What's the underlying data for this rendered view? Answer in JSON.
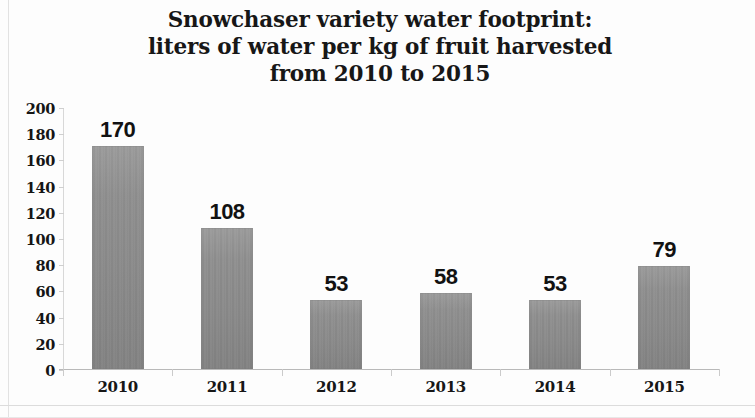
{
  "chart_data": {
    "type": "bar",
    "title": "Snowchaser variety water footprint:\nliters of water per kg of fruit harvested\nfrom 2010 to 2015",
    "categories": [
      "2010",
      "2011",
      "2012",
      "2013",
      "2014",
      "2015"
    ],
    "values": [
      170,
      108,
      53,
      58,
      53,
      79
    ],
    "data_labels": [
      "170",
      "108",
      "53",
      "58",
      "53",
      "79"
    ],
    "series": [
      {
        "name": "liters of water per kg of fruit",
        "values": [
          170,
          108,
          53,
          58,
          53,
          79
        ]
      }
    ],
    "xlabel": "",
    "ylabel": "",
    "ylim": [
      0,
      200
    ],
    "ytick_step": 20,
    "ytick_labels": [
      "200",
      "180",
      "160",
      "140",
      "120",
      "100",
      "80",
      "60",
      "40",
      "20",
      "0"
    ],
    "grid": false,
    "legend": false,
    "legend_position": "none",
    "bar_color": "#8c8c8c",
    "axis_color": "#c4c4c4",
    "text_color": "#151515",
    "background_color": "#fdfdfd"
  }
}
